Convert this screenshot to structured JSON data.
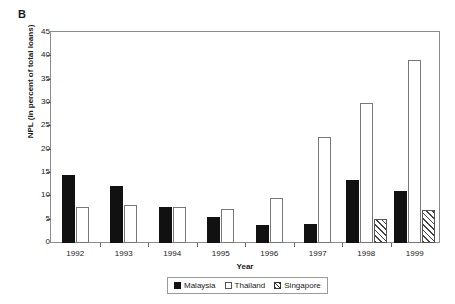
{
  "panel": {
    "label": "B"
  },
  "chart_data": {
    "type": "bar",
    "title": "",
    "subtitle": "",
    "xlabel": "Year",
    "ylabel": "NPL (in percent of total loans)",
    "categories": [
      "1992",
      "1993",
      "1994",
      "1995",
      "1996",
      "1997",
      "1998",
      "1999"
    ],
    "series": [
      {
        "name": "Malaysia",
        "style": "solid-black",
        "values": [
          14.5,
          12.3,
          7.8,
          5.6,
          3.9,
          4.1,
          13.6,
          11.2
        ]
      },
      {
        "name": "Thailand",
        "style": "open-white",
        "values": [
          7.8,
          8.2,
          7.8,
          7.2,
          9.7,
          22.8,
          29.9,
          39.3
        ]
      },
      {
        "name": "Singapore",
        "style": "diagonal-hatch",
        "values": [
          null,
          null,
          null,
          null,
          null,
          null,
          5.1,
          7.0
        ]
      }
    ],
    "ylim": [
      0,
      45
    ],
    "yticks": [
      0,
      5,
      10,
      15,
      20,
      25,
      30,
      35,
      40,
      45
    ],
    "ytick_labels": [
      "0",
      "5",
      "10",
      "15",
      "20",
      "25",
      "30",
      "35",
      "40",
      "45"
    ],
    "grid": false,
    "legend_position": "bottom-center",
    "legend_entries": [
      "Malaysia",
      "Thailand",
      "Singapore"
    ]
  },
  "colors": {
    "malaysia": "#111111",
    "thailand": "#ffffff",
    "singapore_hatch": "#444444",
    "frame": "#8c8c8c",
    "text": "#1a1a1a"
  }
}
